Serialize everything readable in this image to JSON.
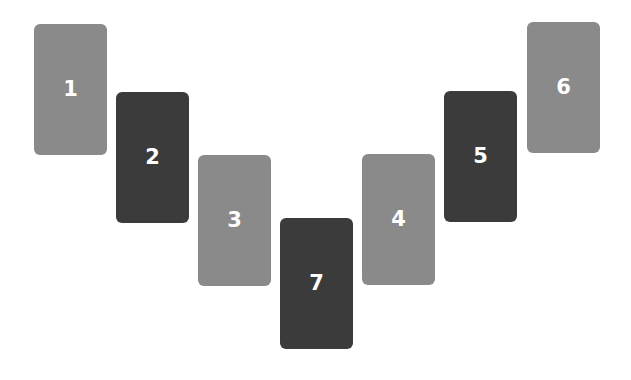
{
  "spread": {
    "cards": [
      {
        "number": "1",
        "x": 34,
        "y": 24,
        "tone": "light"
      },
      {
        "number": "2",
        "x": 116,
        "y": 92,
        "tone": "dark"
      },
      {
        "number": "3",
        "x": 198,
        "y": 155,
        "tone": "light"
      },
      {
        "number": "7",
        "x": 280,
        "y": 218,
        "tone": "dark"
      },
      {
        "number": "4",
        "x": 362,
        "y": 154,
        "tone": "light"
      },
      {
        "number": "5",
        "x": 444,
        "y": 91,
        "tone": "dark"
      },
      {
        "number": "6",
        "x": 527,
        "y": 22,
        "tone": "light"
      }
    ],
    "colors": {
      "light": "#8a8a8a",
      "dark": "#3b3b3b",
      "text": "#ffffff",
      "background": "#ffffff"
    }
  }
}
